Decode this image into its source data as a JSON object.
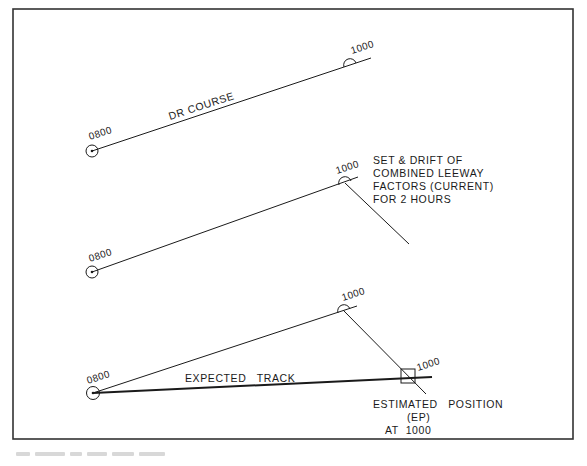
{
  "figure": {
    "panel1": {
      "start_label": "0800",
      "end_label": "1000",
      "course_label": "DR COURSE"
    },
    "panel2": {
      "start_label": "0800",
      "end_label": "1000",
      "note_lines": [
        "SET & DRIFT OF",
        "COMBINED LEEWAY",
        "FACTORS (CURRENT)",
        "FOR 2 HOURS"
      ]
    },
    "panel3": {
      "start_label": "0800",
      "dr_end_label": "1000",
      "ep_label": "1000",
      "track_label": "EXPECTED   TRACK",
      "ep_note_lines": [
        "ESTIMATED   POSITION",
        "(EP)",
        "AT  1000"
      ]
    },
    "caption": ""
  }
}
